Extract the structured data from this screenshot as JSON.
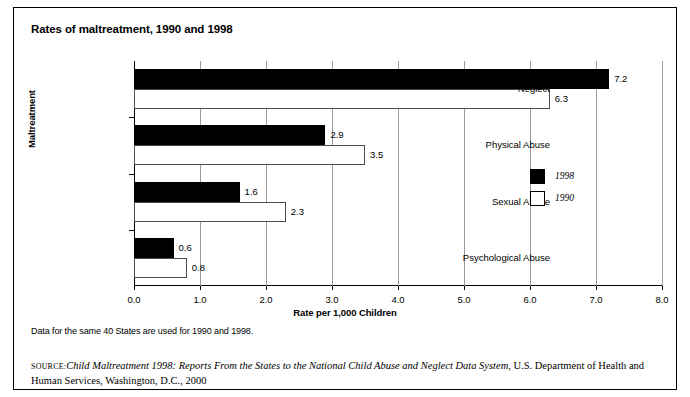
{
  "chart_data": {
    "type": "bar",
    "orientation": "horizontal",
    "title": "Rates of maltreatment, 1990 and 1998",
    "xlabel": "Rate per 1,000 Children",
    "ylabel": "Maltreatment",
    "categories": [
      "Neglect",
      "Physical Abuse",
      "Sexual Abuse",
      "Psychological Abuse"
    ],
    "series": [
      {
        "name": "1998",
        "color": "#000000",
        "values": [
          7.2,
          2.9,
          1.6,
          0.6
        ]
      },
      {
        "name": "1990",
        "color": "#ffffff",
        "values": [
          6.3,
          3.5,
          2.3,
          0.8
        ]
      }
    ],
    "xlim": [
      0.0,
      8.0
    ],
    "xticks": [
      "0.0",
      "1.0",
      "2.0",
      "3.0",
      "4.0",
      "5.0",
      "6.0",
      "7.0",
      "8.0"
    ],
    "grid": true,
    "legend_position": "right-middle",
    "value_labels": {
      "1998": [
        "7.2",
        "2.9",
        "1.6",
        "0.6"
      ],
      "1990": [
        "6.3",
        "3.5",
        "2.3",
        "0.8"
      ]
    }
  },
  "notes": {
    "data_note": "Data for the same 40 States are used for 1990 and 1998.",
    "source_prefix": "SOURCE:",
    "source_italic": "Child Maltreatment 1998: Reports From the States to the National Child Abuse and Neglect Data System",
    "source_rest": ", U.S. Department of Health and Human Services, Washington, D.C., 2000"
  }
}
